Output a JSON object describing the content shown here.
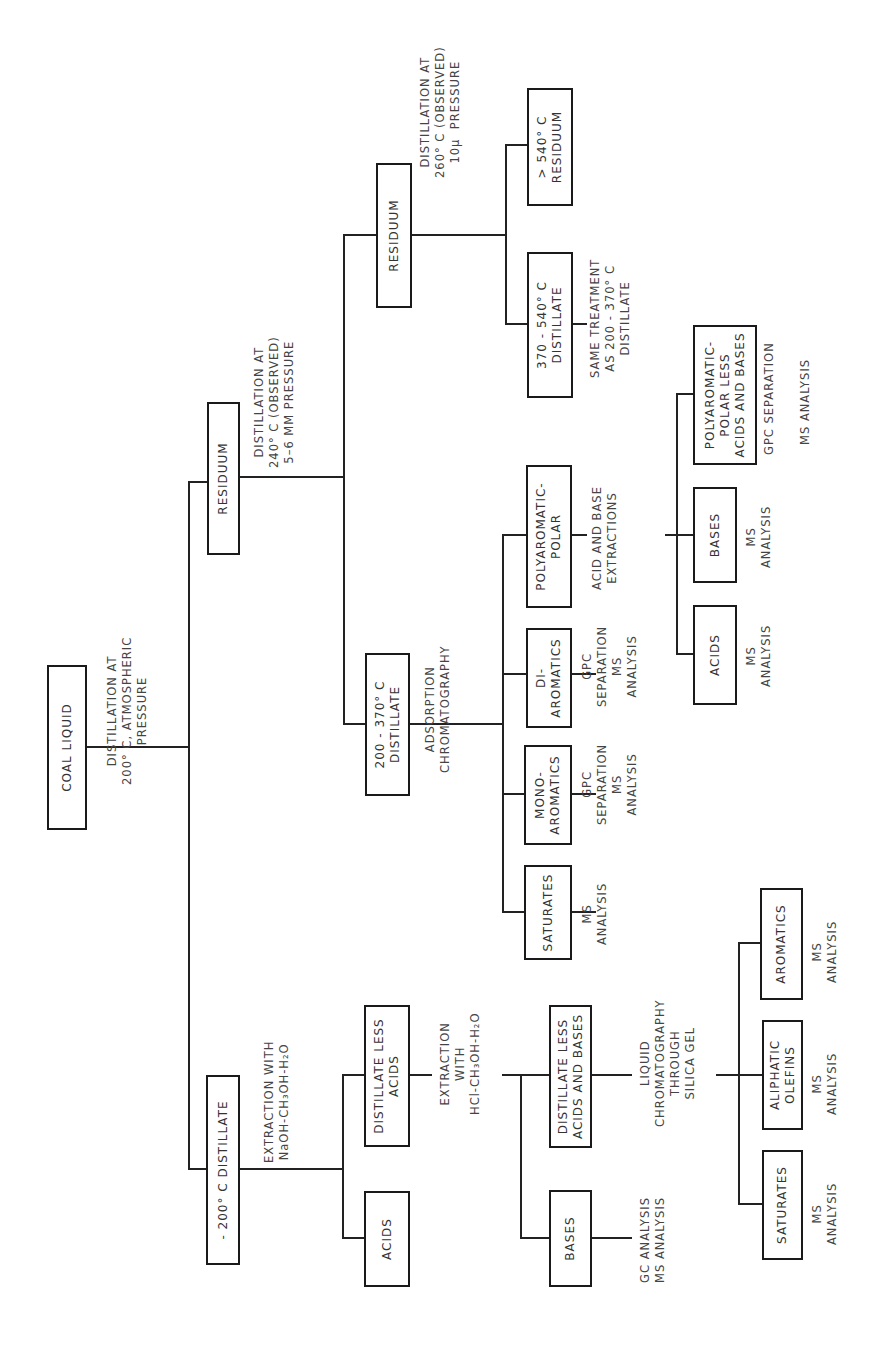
{
  "nodes": {
    "coal_liquid": "COAL LIQUID",
    "minus200_distillate": "- 200° C DISTILLATE",
    "residuum_1": "RESIDUUM",
    "acids_1": "ACIDS",
    "distillate_less_acids": "DISTILLATE LESS\nACIDS",
    "bases_1": "BASES",
    "distillate_less_acids_bases": "DISTILLATE LESS\nACIDS AND BASES",
    "saturates_1": "SATURATES",
    "aliphatic_olefins": "ALIPHATIC\nOLEFINS",
    "aromatics": "AROMATICS",
    "distillate_200_370": "200 - 370° C\nDISTILLATE",
    "saturates_2": "SATURATES",
    "mono_aromatics": "MONO-\nAROMATICS",
    "di_aromatics": "DI-\nAROMATICS",
    "polyaromatic_polar": "POLYAROMATIC-\nPOLAR",
    "residuum_2": "RESIDUUM",
    "distillate_370_540": "370 - 540° C\nDISTILLATE",
    "residuum_540": "> 540° C\nRESIDUUM",
    "acids_2": "ACIDS",
    "bases_2": "BASES",
    "polyaromatic_polar_less": "POLYAROMATIC-\nPOLAR LESS\nACIDS AND BASES"
  },
  "labels": {
    "dist_200_atm": "DISTILLATION AT\n200° C, ATMOSPHERIC\nPRESSURE",
    "extraction_naoh": "EXTRACTION WITH\nNaOH-CH₃OH-H₂O",
    "extraction_hcl": "EXTRACTION\nWITH\nHCl-CH₃OH-H₂O",
    "gc_ms_analysis": "GC ANALYSIS\nMS ANALYSIS",
    "liquid_chromatography": "LIQUID\nCHROMATOGRAPHY\nTHROUGH\nSILICA GEL",
    "ms_analysis_sat1": "MS\nANALYSIS",
    "ms_analysis_olefins": "MS\nANALYSIS",
    "ms_analysis_arom": "MS\nANALYSIS",
    "dist_240": "DISTILLATION AT\n240° C (OBSERVED)\n5–6 MM PRESSURE",
    "adsorption_chrom": "ADSORPTION\nCHROMATOGRAPHY",
    "ms_analysis_sat2": "MS\nANALYSIS",
    "gpc_ms_mono": "GPC\nSEPARATION\nMS\nANALYSIS",
    "gpc_ms_di": "GPC\nSEPARATION\nMS\nANALYSIS",
    "acid_base_extractions": "ACID AND BASE\nEXTRACTIONS",
    "dist_260": "DISTILLATION AT\n260° C (OBSERVED)\n10μ  PRESSURE",
    "same_treatment": "SAME TREATMENT\nAS 200 - 370° C\nDISTILLATE",
    "ms_analysis_acids2": "MS\nANALYSIS",
    "ms_analysis_bases2": "MS\nANALYSIS",
    "gpc_separation": "GPC SEPARATION",
    "ms_analysis_poly": "MS ANALYSIS"
  }
}
